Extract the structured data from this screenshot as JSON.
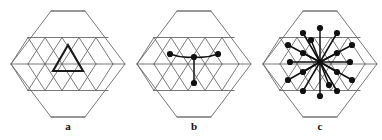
{
  "figure": {
    "title": "",
    "background_color": "#ffffff",
    "width": 382,
    "height": 140,
    "panels": [
      {
        "id": "a",
        "label": "a",
        "label_x": 68,
        "label_y": 126,
        "center_x": 68,
        "center_y": 64,
        "description": "hexagonal triangular lattice with one upward triangle highlighted in bold"
      },
      {
        "id": "b",
        "label": "b",
        "label_x": 194,
        "label_y": 126,
        "center_x": 194,
        "center_y": 64,
        "description": "hexagonal triangular lattice with a central node joined by edges to three neighbouring nodes"
      },
      {
        "id": "c",
        "label": "c",
        "label_x": 320,
        "label_y": 126,
        "center_x": 320,
        "center_y": 64,
        "description": "hexagonal triangular lattice with a central hub node joined by edges to eighteen surrounding nodes"
      }
    ]
  },
  "geometry": {
    "lattice_unit": 17,
    "hex_half_width": 57,
    "hex_half_height": 53,
    "hex_top_half_edge": 17,
    "grid_stroke": "#6b6b6b",
    "grid_stroke_width": 0.9,
    "bold_stroke": "#1a1a1a",
    "bold_stroke_width": 2.1,
    "node_fill": "#111111",
    "node_radius": 3.1,
    "edge_stroke": "#111111",
    "edge_stroke_width": 1.5
  },
  "panel_a": {
    "highlight_triangle": {
      "apex_x": 68,
      "apex_y": 45,
      "base_left_x": 53,
      "base_left_y": 71,
      "base_right_x": 83,
      "base_right_y": 71
    }
  },
  "panel_b": {
    "hub": {
      "x": 194,
      "y": 57
    },
    "nodes": [
      {
        "x": 194,
        "y": 57,
        "role": "hub"
      },
      {
        "x": 170,
        "y": 54,
        "role": "neighbour-left"
      },
      {
        "x": 218,
        "y": 54,
        "role": "neighbour-right"
      },
      {
        "x": 194,
        "y": 83,
        "role": "neighbour-down"
      }
    ],
    "edges": [
      {
        "from": 0,
        "to": 1
      },
      {
        "from": 0,
        "to": 2
      },
      {
        "from": 0,
        "to": 3
      }
    ],
    "edge_count": 3,
    "node_count": 4
  },
  "panel_c": {
    "hub": {
      "x": 320,
      "y": 62
    },
    "nodes": [
      {
        "x": 320,
        "y": 62,
        "role": "hub"
      },
      {
        "x": 320,
        "y": 28,
        "role": "spoke"
      },
      {
        "x": 320,
        "y": 96,
        "role": "spoke"
      },
      {
        "x": 290,
        "y": 62,
        "role": "spoke"
      },
      {
        "x": 350,
        "y": 62,
        "role": "spoke"
      },
      {
        "x": 303,
        "y": 33,
        "role": "spoke"
      },
      {
        "x": 337,
        "y": 33,
        "role": "spoke"
      },
      {
        "x": 303,
        "y": 91,
        "role": "spoke"
      },
      {
        "x": 337,
        "y": 91,
        "role": "spoke"
      },
      {
        "x": 303,
        "y": 53,
        "role": "spoke"
      },
      {
        "x": 337,
        "y": 53,
        "role": "spoke"
      },
      {
        "x": 303,
        "y": 72,
        "role": "spoke"
      },
      {
        "x": 337,
        "y": 72,
        "role": "spoke"
      },
      {
        "x": 288,
        "y": 45,
        "role": "spoke"
      },
      {
        "x": 352,
        "y": 45,
        "role": "spoke"
      },
      {
        "x": 288,
        "y": 80,
        "role": "spoke"
      },
      {
        "x": 352,
        "y": 80,
        "role": "spoke"
      },
      {
        "x": 311,
        "y": 40,
        "role": "spoke"
      },
      {
        "x": 329,
        "y": 85,
        "role": "spoke"
      }
    ],
    "edge_count": 18,
    "node_count": 19
  }
}
